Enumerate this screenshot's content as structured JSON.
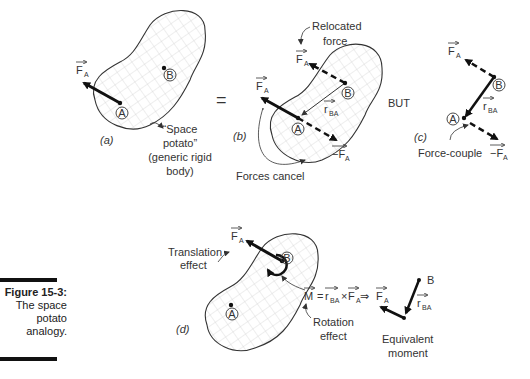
{
  "caption": {
    "title": "Figure 15-3:",
    "lines": [
      "The space",
      "potato",
      "analogy."
    ]
  },
  "panels": {
    "a": {
      "label": "(a)",
      "force": "F",
      "force_sub": "A",
      "point_a": "A",
      "point_b": "B",
      "note_lines": [
        "“Space",
        "potato”",
        "(generic rigid",
        "body)"
      ]
    },
    "equals": "=",
    "b": {
      "label": "(b)",
      "relocated_lines": [
        "Relocated",
        "force"
      ],
      "force": "F",
      "force_sub": "A",
      "neg_force": "−F",
      "neg_force_sub": "A",
      "r": "r",
      "r_sub": "BA",
      "point_a": "A",
      "point_b": "B",
      "forces_cancel": "Forces cancel"
    },
    "but": "BUT",
    "c": {
      "label": "(c)",
      "force": "F",
      "force_sub": "A",
      "neg_force": "−F",
      "neg_force_sub": "A",
      "r": "r",
      "r_sub": "BA",
      "point_a": "A",
      "point_b": "B",
      "force_couple": "Force-couple"
    },
    "d": {
      "label": "(d)",
      "translation_lines": [
        "Translation",
        "effect"
      ],
      "force": "F",
      "force_sub": "A",
      "point_a": "A",
      "point_b": "B",
      "moment": "M",
      "eq_equals": "=",
      "eq_r": "r",
      "eq_r_sub": "BA",
      "eq_cross": "×",
      "eq_f": "F",
      "eq_f_sub": "A",
      "implies": "⇒",
      "rot_lines": [
        "Rotation",
        "effect"
      ],
      "equiv_f": "F",
      "equiv_f_sub": "A",
      "equiv_r": "r",
      "equiv_r_sub": "BA",
      "equiv_b": "B",
      "equiv_lines": [
        "Equivalent",
        "moment"
      ]
    }
  }
}
